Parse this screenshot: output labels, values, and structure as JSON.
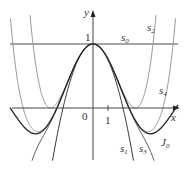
{
  "chart_data": {
    "type": "line",
    "title": "",
    "xlabel": "x",
    "ylabel": "y",
    "xlim": [
      -6.2,
      6.3
    ],
    "ylim": [
      -0.95,
      1.65
    ],
    "grid": false,
    "tick_labels": {
      "origin": "0",
      "x": [
        "1"
      ],
      "y": [
        "1"
      ]
    },
    "series": [
      {
        "name": "s0",
        "label": "s",
        "sub": "0",
        "formula": "1",
        "color": "#333333"
      },
      {
        "name": "s1",
        "label": "s",
        "sub": "1",
        "formula": "1 - x^2/4",
        "color": "#333333"
      },
      {
        "name": "s2",
        "label": "s",
        "sub": "2",
        "formula": "1 - x^2/4 + x^4/64",
        "color": "#999999"
      },
      {
        "name": "s3",
        "label": "s",
        "sub": "3",
        "formula": "1 - x^2/4 + x^4/64 - x^6/2304",
        "color": "#555555"
      },
      {
        "name": "s4",
        "label": "s",
        "sub": "4",
        "formula": "1 - x^2/4 + x^4/64 - x^6/2304 + x^8/147456",
        "color": "#999999"
      },
      {
        "name": "J0",
        "label": "J",
        "sub": "0",
        "formula": "Bessel J0(x)",
        "color": "#222222"
      }
    ]
  },
  "labels": {
    "y_axis": "y",
    "x_axis": "x",
    "origin": "0",
    "x_tick": "1",
    "y_tick": "1",
    "s0": "s",
    "s0_sub": "0",
    "s1": "s",
    "s1_sub": "1",
    "s2": "s",
    "s2_sub": "2",
    "s3": "s",
    "s3_sub": "3",
    "s4": "s",
    "s4_sub": "4",
    "J0": "J",
    "J0_sub": "0"
  }
}
